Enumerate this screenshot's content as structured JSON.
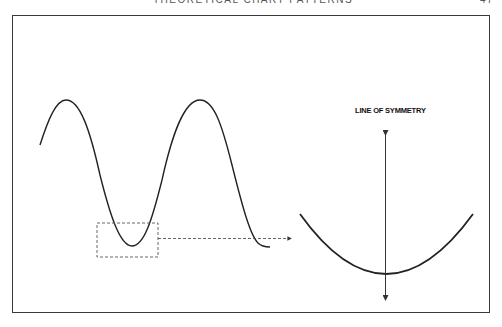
{
  "page": {
    "running_head": "THEORETICAL CHART PATTERNS",
    "page_number": "47"
  },
  "figure": {
    "symmetry_label": "LINE OF SYMMETRY",
    "elements": [
      {
        "name": "sine-wave",
        "description": "Oscillating wave with two peaks and two troughs"
      },
      {
        "name": "zoom-box",
        "description": "Dashed rectangle around first trough"
      },
      {
        "name": "zoom-arrow",
        "description": "Dashed arrow from box to enlarged curve"
      },
      {
        "name": "enlarged-trough",
        "description": "Magnified U-shaped trough curve"
      },
      {
        "name": "symmetry-axis",
        "description": "Vertical double-headed arrow through trough minimum"
      }
    ],
    "colors": {
      "line": "#222222",
      "dashed": "#555555",
      "frame": "#3a3a3a"
    }
  }
}
